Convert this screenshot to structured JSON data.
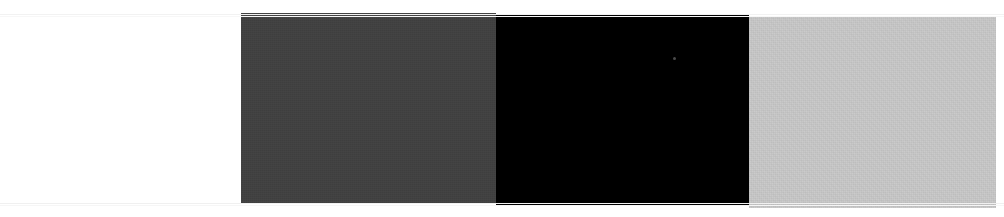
{
  "image": {
    "title": "Color Band Strip",
    "width": 1004,
    "height": 217,
    "background_color": "#ffffff",
    "description": "Four horizontal color bands on a white background"
  },
  "bands": [
    {
      "name": "white-band",
      "label": "White",
      "color": "#ffffff",
      "x": 0,
      "y": 0,
      "width": 241,
      "height": 217,
      "textured": false
    },
    {
      "name": "dark-gray-band",
      "label": "Dark Gray",
      "color": "#404040",
      "x": 241,
      "y": 13,
      "width": 255,
      "height": 191,
      "textured": true
    },
    {
      "name": "black-band",
      "label": "Black",
      "color": "#000000",
      "x": 496,
      "y": 15,
      "width": 253,
      "height": 191,
      "textured": false
    },
    {
      "name": "light-gray-band",
      "label": "Light Gray",
      "color": "#c8c8c8",
      "x": 749,
      "y": 17,
      "width": 247,
      "height": 191,
      "textured": true
    }
  ],
  "artifacts": {
    "scanlines": [
      {
        "name": "top-scanline",
        "y": 14,
        "width": 1004,
        "color": "#f2f2f2"
      },
      {
        "name": "top-scanline-secondary",
        "y": 16,
        "width": 1004,
        "color": "#f7f7f7"
      },
      {
        "name": "bottom-scanline",
        "y": 203,
        "width": 1004,
        "color": "#f0f0f0"
      },
      {
        "name": "bottom-scanline-secondary",
        "y": 205,
        "width": 1004,
        "color": "#f6f6f6"
      }
    ],
    "speck": {
      "name": "highlight-speck",
      "x": 673,
      "y": 57,
      "size": 3,
      "color": "#4a4a4a"
    }
  }
}
